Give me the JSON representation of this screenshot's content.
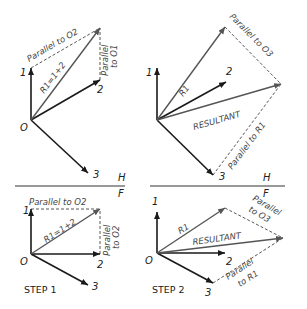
{
  "labels": {
    "origin": "O",
    "v1": "1",
    "v2": "2",
    "v3": "3",
    "h": "H",
    "f": "F",
    "parallel_to_o2": "Parallel to O2",
    "parallel": "Parallel",
    "to_o1": "to O1",
    "to_o2": "to O2",
    "r1_eq": "R1=1+2",
    "r1": "R1",
    "resultant": "RESULTANT",
    "parallel_to_o3": "Parallel to O3",
    "parallel_to_r1": "Parallel to R1",
    "to_o3": "to O3",
    "to_r1": "to R1",
    "step1": "STEP 1",
    "step2": "STEP 2"
  }
}
